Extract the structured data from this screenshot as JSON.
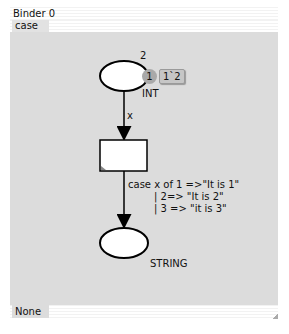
{
  "window": {
    "title": "Binder 0",
    "tab_label": "case",
    "bottom_tab_label": "None"
  },
  "net": {
    "place_top": {
      "initial_marking": "2",
      "token_count": "1",
      "current_marking": "1`2",
      "colorset": "INT"
    },
    "arc_in": {
      "inscription": "x"
    },
    "transition": {
      "name": ""
    },
    "arc_out": {
      "inscription_line1": "case x of 1 =>\"It is 1\"",
      "inscription_line2": "| 2=> \"It is 2\"",
      "inscription_line3": "| 3 => \"it is 3\""
    },
    "place_bottom": {
      "colorset": "STRING"
    }
  }
}
